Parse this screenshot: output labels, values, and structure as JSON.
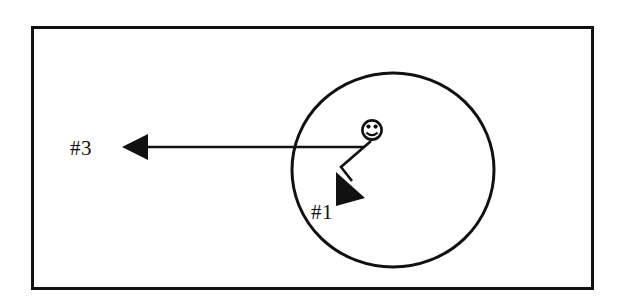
{
  "figure": {
    "type": "schematic-diagram",
    "title": "",
    "background_color": "#ffffff",
    "ink_color": "#111111",
    "canvas": {
      "width": 623,
      "height": 306
    }
  },
  "frame": {
    "name": "outer-border-rectangle",
    "x": 31,
    "y": 26,
    "width": 563,
    "height": 264,
    "stroke_width": 3,
    "color": "#111111"
  },
  "region": {
    "name": "circular-region",
    "shape": "ellipse",
    "center_x": 393,
    "center_y": 170,
    "radius_x": 101,
    "radius_y": 97,
    "stroke_width": 3,
    "color": "#111111"
  },
  "actor": {
    "name": "smiley-face",
    "center_x": 372,
    "center_y": 130,
    "radius": 10,
    "stroke_width": 2.6,
    "color": "#111111",
    "eye_radius": 2.1,
    "eye_offset_x": 3.5,
    "eye_offset_y": -2.6
  },
  "arrows": [
    {
      "id": "arrow-3",
      "label": "#3",
      "direction": "left",
      "start_x": 365,
      "start_y": 147,
      "end_x": 122,
      "end_y": 147,
      "stroke_width": 2.6,
      "head_length": 26,
      "head_half_width": 13,
      "color": "#111111"
    },
    {
      "id": "arrow-1",
      "label": "#1",
      "direction": "down-right",
      "start_x": 371,
      "start_y": 141,
      "bend_x": 341,
      "bend_y": 166,
      "end_x": 361,
      "end_y": 196,
      "stroke_width": 2.6,
      "head_length": 28,
      "head_half_width": 15,
      "color": "#111111"
    }
  ],
  "labels": [
    {
      "id": "label-3",
      "text": "#3",
      "x": 70,
      "y": 155,
      "anchor": "start",
      "font_size": 21
    },
    {
      "id": "label-1",
      "text": "#1",
      "x": 311,
      "y": 219,
      "anchor": "start",
      "font_size": 21
    }
  ]
}
